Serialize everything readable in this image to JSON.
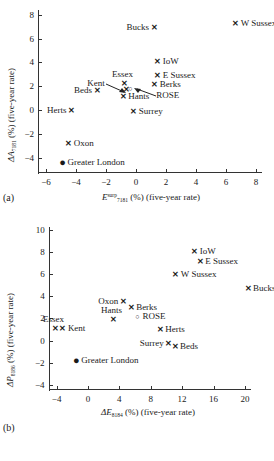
{
  "figure": {
    "panels": [
      {
        "tag": "(a)",
        "xlabel_prefix": "E",
        "xlabel_sup": "surp",
        "xlabel_sub": "7181",
        "xlabel_suffix": " (%) (five-year rate)",
        "ylabel_prefix": "ΔA",
        "ylabel_sub": "7181",
        "ylabel_suffix": " (%) (five-year rate)"
      },
      {
        "tag": "(b)",
        "xlabel_prefix": "ΔE",
        "xlabel_sup": "",
        "xlabel_sub": "8184",
        "xlabel_suffix": " (%) (five-year rate)",
        "ylabel_prefix": "ΔP",
        "ylabel_sub": "8186",
        "ylabel_suffix": " (%) (five-year rate)"
      }
    ]
  },
  "chart_data": [
    {
      "type": "scatter",
      "panel": "(a)",
      "title": "",
      "xlabel": "E_7181^surp (%) (five-year rate)",
      "ylabel": "ΔA_7181 (%) (five-year rate)",
      "xlim": [
        -6.6,
        8.6
      ],
      "ylim": [
        -5.2,
        8.4
      ],
      "xticks": [
        -6,
        -4,
        -2,
        0,
        2,
        4,
        6,
        8
      ],
      "xticklabels": [
        "−6",
        "−4",
        "−2",
        "0",
        "2",
        "4",
        "6",
        "8"
      ],
      "yticks": [
        -4,
        -2,
        0,
        2,
        4,
        6,
        8
      ],
      "yticklabels": [
        "−4",
        "−2",
        "0",
        "2",
        "4",
        "6",
        "8"
      ],
      "grid": false,
      "legend": "none",
      "points": [
        {
          "label": "W Sussex",
          "x": 6.65,
          "y": 7.3,
          "marker": "cross",
          "label_side": "right"
        },
        {
          "label": "Bucks",
          "x": 1.2,
          "y": 7.0,
          "marker": "cross",
          "label_side": "left"
        },
        {
          "label": "IoW",
          "x": 1.45,
          "y": 4.1,
          "marker": "cross",
          "label_side": "right"
        },
        {
          "label": "E Sussex",
          "x": 1.45,
          "y": 2.98,
          "marker": "cross",
          "label_side": "right"
        },
        {
          "label": "Berks",
          "x": 1.25,
          "y": 2.18,
          "marker": "cross",
          "label_side": "right"
        },
        {
          "label": "Essex",
          "x": -0.8,
          "y": 2.28,
          "marker": "cross",
          "label_side": "above"
        },
        {
          "label": "Kent",
          "x": -0.62,
          "y": 1.78,
          "marker": "cross",
          "label_side": "arrow-left"
        },
        {
          "label": "ROSE",
          "x": -0.38,
          "y": 1.86,
          "marker": "ring",
          "label_side": "arrow-right"
        },
        {
          "label": "Beds",
          "x": -2.6,
          "y": 1.68,
          "marker": "cross",
          "label_side": "left"
        },
        {
          "label": "Hants",
          "x": -0.85,
          "y": 1.18,
          "marker": "cross",
          "label_side": "right"
        },
        {
          "label": "Herts",
          "x": -4.3,
          "y": 0.0,
          "marker": "cross",
          "label_side": "left"
        },
        {
          "label": "Surrey",
          "x": -0.15,
          "y": -0.08,
          "marker": "cross",
          "label_side": "right"
        },
        {
          "label": "Oxon",
          "x": -4.48,
          "y": -2.8,
          "marker": "cross",
          "label_side": "right"
        },
        {
          "label": "Greater London",
          "x": -4.9,
          "y": -4.4,
          "marker": "dot",
          "label_side": "right"
        }
      ]
    },
    {
      "type": "scatter",
      "panel": "(b)",
      "title": "",
      "xlabel": "ΔE_8184 (%) (five-year rate)",
      "ylabel": "ΔP_8186 (%) (five-year rate)",
      "xlim": [
        -6.5,
        21.8
      ],
      "ylim": [
        -4.4,
        10.3
      ],
      "xticks": [
        -4,
        0,
        4,
        8,
        12,
        16,
        20
      ],
      "xticklabels": [
        "−4",
        "0",
        "4",
        "8",
        "12",
        "16",
        "20"
      ],
      "yticks": [
        -4,
        -2,
        0,
        2,
        4,
        6,
        8,
        10
      ],
      "yticklabels": [
        "−4",
        "−2",
        "0",
        "2",
        "4",
        "6",
        "8",
        "10"
      ],
      "grid": false,
      "legend": "none",
      "points": [
        {
          "label": "IoW",
          "x": 13.6,
          "y": 8.1,
          "marker": "cross",
          "label_side": "right"
        },
        {
          "label": "E Sussex",
          "x": 14.3,
          "y": 7.2,
          "marker": "cross",
          "label_side": "right"
        },
        {
          "label": "W Sussex",
          "x": 11.2,
          "y": 6.0,
          "marker": "cross",
          "label_side": "right"
        },
        {
          "label": "Bucks",
          "x": 20.4,
          "y": 4.8,
          "marker": "cross",
          "label_side": "right"
        },
        {
          "label": "Oxon",
          "x": 4.5,
          "y": 3.58,
          "marker": "cross",
          "label_side": "left"
        },
        {
          "label": "Berks",
          "x": 5.5,
          "y": 3.05,
          "marker": "cross",
          "label_side": "right"
        },
        {
          "label": "ROSE",
          "x": 6.3,
          "y": 2.2,
          "marker": "ring",
          "label_side": "right"
        },
        {
          "label": "Hants",
          "x": 3.2,
          "y": 1.95,
          "marker": "cross",
          "label_side": "above"
        },
        {
          "label": "Essex",
          "x": -4.2,
          "y": 1.18,
          "marker": "cross",
          "label_side": "above"
        },
        {
          "label": "Kent",
          "x": -3.2,
          "y": 1.18,
          "marker": "cross",
          "label_side": "right"
        },
        {
          "label": "Herts",
          "x": 9.2,
          "y": 1.0,
          "marker": "cross",
          "label_side": "right"
        },
        {
          "label": "Surrey",
          "x": 10.3,
          "y": -0.2,
          "marker": "cross",
          "label_side": "left"
        },
        {
          "label": "Beds",
          "x": 11.1,
          "y": -0.52,
          "marker": "cross",
          "label_side": "right"
        },
        {
          "label": "Greater London",
          "x": -1.5,
          "y": -1.8,
          "marker": "dot",
          "label_side": "right"
        }
      ]
    }
  ]
}
